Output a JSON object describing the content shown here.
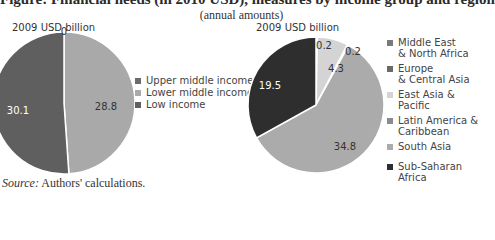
{
  "title": "Figure: Financial needs (in 2010 USD), measures by income group and region",
  "subtitle": "(annual amounts)",
  "source": {
    "label": "Source:",
    "text": " Authors' calculations."
  },
  "chart_data": [
    {
      "type": "pie",
      "title": "By income group",
      "unit_label": "2009 USD billion",
      "categories": [
        "Upper middle income",
        "Lower middle income",
        "Low income"
      ],
      "values": [
        0,
        28.8,
        30.1
      ],
      "colors": [
        "#6b6b6b",
        "#a9a9a9",
        "#5f5f5f"
      ],
      "label_colors": [
        "#333333",
        "#333333",
        "#ffffff"
      ],
      "start_angle": "12 o'clock",
      "direction": "clockwise",
      "legend_position": "right"
    },
    {
      "type": "pie",
      "title": "By region",
      "unit_label": "2009 USD billion",
      "categories": [
        "Middle East & North Africa",
        "Europe & Central Asia",
        "East Asia & Pacific",
        "Latin America & Caribbean",
        "South Asia",
        "Sub-Saharan Africa"
      ],
      "legend_lines": [
        [
          "Middle East",
          "& North Africa"
        ],
        [
          "Europe",
          "& Central Asia"
        ],
        [
          "East Asia & Pacific"
        ],
        [
          "Latin America &",
          "Caribbean"
        ],
        [
          "South Asia"
        ],
        [
          "Sub-Saharan Africa"
        ]
      ],
      "values": [
        0,
        0.2,
        4.3,
        0.2,
        34.8,
        19.5
      ],
      "colors": [
        "#7a7a7a",
        "#6a6a6a",
        "#d4d4d4",
        "#8c8c8c",
        "#ababab",
        "#2e2e2e"
      ],
      "label_colors": [
        "#333333",
        "#333333",
        "#333333",
        "#333333",
        "#333333",
        "#ffffff"
      ],
      "start_angle": "12 o'clock",
      "direction": "clockwise",
      "legend_position": "right"
    }
  ]
}
